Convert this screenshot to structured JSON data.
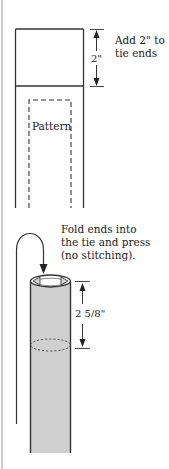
{
  "diagram": {
    "step1": {
      "annotation_line1": "Add 2\" to",
      "annotation_line2": "tie ends",
      "dimension_label": "2\"",
      "pattern_label": "Pattern"
    },
    "step2": {
      "annotation_line1": "Fold ends into",
      "annotation_line2": "the tie and press",
      "annotation_line3": "(no stitching).",
      "dimension_label": "2 5/8\""
    },
    "colors": {
      "line": "#333333",
      "tube_fill": "#cfcfcf",
      "page_edge": "#bbbbbb",
      "background": "#ffffff"
    }
  }
}
